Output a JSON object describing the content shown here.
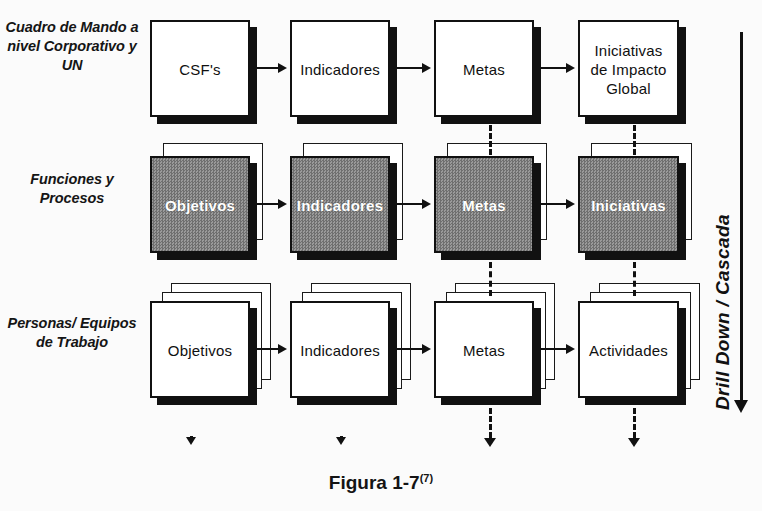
{
  "figure": {
    "caption_text": "Figura 1-7",
    "caption_superscript": "(7)",
    "background_color": "#fbfbfb",
    "line_color": "#111111",
    "filled_box_color": "#848484",
    "filled_box_text_color": "#ffffff"
  },
  "axis": {
    "label": "Drill Down / Cascada",
    "direction": "down"
  },
  "rows": [
    {
      "id": "corporativo",
      "label": "Cuadro de\nMando a\nnivel\nCorporativo\ny UN",
      "stack_count": 1,
      "filled": false,
      "nodes": [
        {
          "id": "r1c1",
          "label": "CSF's"
        },
        {
          "id": "r1c2",
          "label": "Indicadores"
        },
        {
          "id": "r1c3",
          "label": "Metas"
        },
        {
          "id": "r1c4",
          "label": "Iniciativas\nde Impacto\nGlobal"
        }
      ]
    },
    {
      "id": "funciones",
      "label": "Funciones y\nProcesos",
      "stack_count": 2,
      "filled": true,
      "nodes": [
        {
          "id": "r2c1",
          "label": "Objetivos"
        },
        {
          "id": "r2c2",
          "label": "Indicadores"
        },
        {
          "id": "r2c3",
          "label": "Metas"
        },
        {
          "id": "r2c4",
          "label": "Iniciativas"
        }
      ]
    },
    {
      "id": "personas",
      "label": "Personas/\nEquipos de\nTrabajo",
      "stack_count": 3,
      "filled": false,
      "nodes": [
        {
          "id": "r3c1",
          "label": "Objetivos"
        },
        {
          "id": "r3c2",
          "label": "Indicadores"
        },
        {
          "id": "r3c3",
          "label": "Metas"
        },
        {
          "id": "r3c4",
          "label": "Actividades"
        }
      ]
    }
  ],
  "connectors": {
    "horizontal_note": "solid arrows left-to-right between columns in every row",
    "vertical_note": "dashed arrows downward in columns 3 and 4 between rows and below row 3",
    "tick_note": "small solitary arrowheads below columns 1 and 2"
  }
}
